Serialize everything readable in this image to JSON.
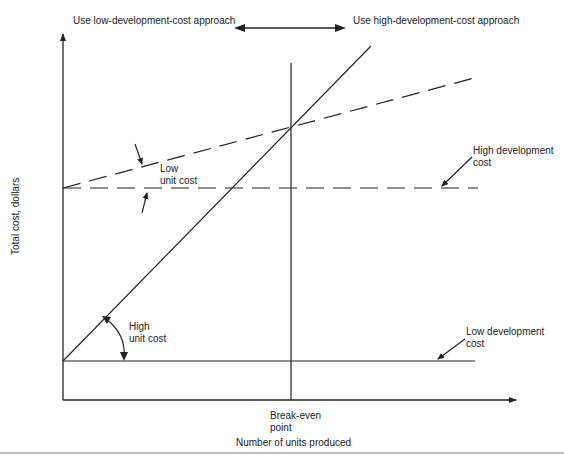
{
  "diagram": {
    "title_left": "Use low-development-cost approach",
    "title_right": "Use high-development-cost approach",
    "x_axis_label": "Number of units produced",
    "y_axis_label": "Total cost, dollars",
    "break_even_label_line1": "Break-even",
    "break_even_label_line2": "point",
    "annotations": {
      "low_unit_cost_line1": "Low",
      "low_unit_cost_line2": "unit cost",
      "high_unit_cost_line1": "High",
      "high_unit_cost_line2": "unit cost",
      "high_dev_cost_line1": "High development",
      "high_dev_cost_line2": "cost",
      "low_dev_cost_line1": "Low development",
      "low_dev_cost_line2": "cost"
    },
    "series": [
      {
        "name": "Low development cost / high unit cost",
        "style": "solid",
        "start_fixed_cost": "low",
        "slope": "steep"
      },
      {
        "name": "High development cost / low unit cost",
        "style": "dashed",
        "start_fixed_cost": "high",
        "slope": "shallow"
      },
      {
        "name": "High development cost baseline",
        "style": "dashed",
        "style_note": "horizontal"
      },
      {
        "name": "Low development cost baseline",
        "style": "solid",
        "style_note": "horizontal"
      }
    ],
    "colors": {
      "line": "#222222",
      "background": "#ffffff",
      "rule": "#bdbdbd"
    }
  }
}
